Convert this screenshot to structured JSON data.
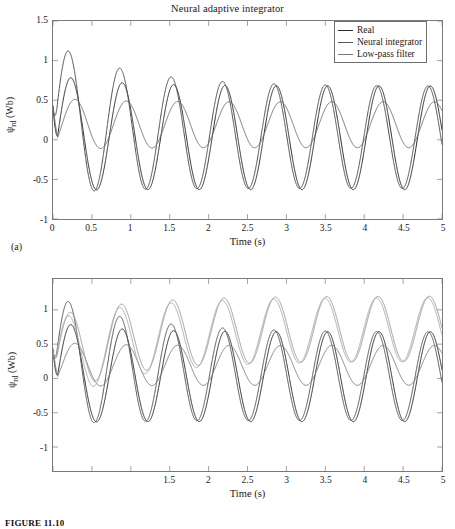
{
  "figure": {
    "caption": "FIGURE 11.10",
    "panel_a_label": "(a)",
    "panel_b_label": "(b)"
  },
  "panel_a": {
    "title": "Neural adaptive integrator",
    "xlabel": "Time (s)",
    "ylabel_main": "ψ",
    "ylabel_sub": "rd",
    "ylabel_unit": " (Wb)",
    "legend": [
      {
        "label": "Real",
        "color": "#2b2b2b",
        "italic": false
      },
      {
        "label": "Neural integrator",
        "color": "#555555",
        "italic": false
      },
      {
        "label": "Low-pass filter",
        "color": "#777777",
        "italic": false
      }
    ]
  },
  "panel_b": {
    "xlabel": "Time (s)",
    "ylabel_main": "ψ",
    "ylabel_sub": "rd",
    "ylabel_unit": " (Wb)",
    "legend": [
      {
        "label": "Real",
        "color": "#2b2b2b",
        "italic": false
      },
      {
        "label": "Neural integrator",
        "color": "#555555",
        "italic": false
      },
      {
        "label": "Low-pass filter",
        "color": "#7d7d7d",
        "italic": false
      },
      {
        "label": "Algorithm 1",
        "color": "#9a9a9a",
        "italic": true
      },
      {
        "label": "Algorithm 2",
        "color": "#ababab",
        "italic": true
      }
    ]
  },
  "chart_data": [
    {
      "id": "a",
      "type": "line",
      "title": "Neural adaptive integrator",
      "xlabel": "Time (s)",
      "ylabel": "ψrd (Wb)",
      "xlim": [
        0,
        5
      ],
      "ylim": [
        -1,
        1.5
      ],
      "xticks": [
        0,
        0.5,
        1,
        1.5,
        2,
        2.5,
        3,
        3.5,
        4,
        4.5,
        5
      ],
      "xtick_labels": [
        "0",
        "0.5",
        "1",
        "1.5",
        "2",
        "2.5",
        "3",
        "3.5",
        "4",
        "4.5",
        "5"
      ],
      "yticks": [
        -1,
        -0.5,
        0,
        0.5,
        1,
        1.5
      ],
      "ytick_labels": [
        "-1",
        "-0.5",
        "0",
        "0.5",
        "1",
        "1.5"
      ],
      "grid": false,
      "legend_position": "top-right",
      "frequency_hz": 1.515,
      "series": [
        {
          "name": "Real",
          "color": "#2b2b2b",
          "width": 1.0,
          "model": "damped_sine",
          "amp_steady": 0.655,
          "amp_initial": 0.735,
          "decay": 1.55,
          "offset_steady": 0.025,
          "offset_initial": 0.09,
          "offset_decay": 1.3,
          "phase": -0.62,
          "start_value": 0.42
        },
        {
          "name": "Neural integrator",
          "color": "#4d4d4d",
          "width": 1.0,
          "model": "damped_sine",
          "amp_steady": 0.645,
          "amp_initial": 0.95,
          "decay": 1.05,
          "offset_steady": 0.03,
          "offset_initial": 0.27,
          "offset_decay": 0.95,
          "phase": -0.33,
          "start_value": 0.4
        },
        {
          "name": "Low-pass filter",
          "color": "#6e6e6e",
          "width": 1.0,
          "model": "damped_sine",
          "amp_steady": 0.29,
          "amp_initial": 0.33,
          "decay": 1.7,
          "offset_steady": 0.19,
          "offset_initial": 0.2,
          "offset_decay": 1.5,
          "phase": -1.12,
          "start_value": 0.44
        }
      ],
      "readings": {
        "peak_overshoot_neural": 1.23,
        "peak_overshoot_time": 0.7,
        "steady_peak": 0.67,
        "steady_trough": -0.62,
        "lowpass_steady_peak": 0.48,
        "lowpass_steady_trough": -0.1
      }
    },
    {
      "id": "b",
      "type": "line",
      "xlabel": "Time (s)",
      "ylabel": "ψrd (Wb)",
      "xlim": [
        0,
        5
      ],
      "ylim": [
        -1.35,
        1.45
      ],
      "xticks": [
        0,
        0.5,
        1,
        1.5,
        2,
        2.5,
        3,
        3.5,
        4,
        4.5,
        5
      ],
      "xtick_labels": [
        "",
        "",
        "",
        "1.5",
        "2",
        "2.5",
        "3",
        "3.5",
        "4",
        "4.5",
        "5"
      ],
      "yticks": [
        -1,
        -0.5,
        0,
        0.5,
        1
      ],
      "ytick_labels": [
        "-1",
        "-0.5",
        "0",
        "0.5",
        "1"
      ],
      "grid": false,
      "legend_position": "bottom-left",
      "frequency_hz": 1.515,
      "series": [
        {
          "name": "Real",
          "color": "#2b2b2b",
          "width": 1.0,
          "model": "damped_sine",
          "amp_steady": 0.655,
          "amp_initial": 0.735,
          "decay": 1.55,
          "offset_steady": 0.025,
          "offset_initial": 0.09,
          "offset_decay": 1.3,
          "phase": -0.62,
          "start_value": 0.42
        },
        {
          "name": "Neural integrator",
          "color": "#555555",
          "width": 1.0,
          "model": "damped_sine",
          "amp_steady": 0.645,
          "amp_initial": 0.95,
          "decay": 1.05,
          "offset_steady": 0.03,
          "offset_initial": 0.27,
          "offset_decay": 0.95,
          "phase": -0.33,
          "start_value": 0.4
        },
        {
          "name": "Low-pass filter",
          "color": "#7d7d7d",
          "width": 1.0,
          "model": "damped_sine",
          "amp_steady": 0.29,
          "amp_initial": 0.33,
          "decay": 1.7,
          "offset_steady": 0.19,
          "offset_initial": 0.2,
          "offset_decay": 1.5,
          "phase": -1.12,
          "start_value": 0.44
        },
        {
          "name": "Algorithm 1",
          "color": "#9a9a9a",
          "width": 1.0,
          "model": "damped_sine",
          "amp_steady": 0.475,
          "amp_initial": 0.6,
          "decay": 1.35,
          "offset_steady": 0.725,
          "offset_initial": 0.3,
          "offset_decay": 1.15,
          "phase": -0.5,
          "start_value": 0.4
        },
        {
          "name": "Algorithm 2",
          "color": "#ababab",
          "width": 1.0,
          "model": "damped_sine",
          "amp_steady": 0.465,
          "amp_initial": 0.62,
          "decay": 1.2,
          "offset_steady": 0.715,
          "offset_initial": 0.24,
          "offset_decay": 1.0,
          "phase": -0.3,
          "start_value": 0.38
        }
      ],
      "readings": {
        "algorithm_steady_peak": 1.19,
        "algorithm_steady_trough": 0.25,
        "real_steady_peak": 0.67,
        "real_steady_trough": -0.62
      }
    }
  ]
}
